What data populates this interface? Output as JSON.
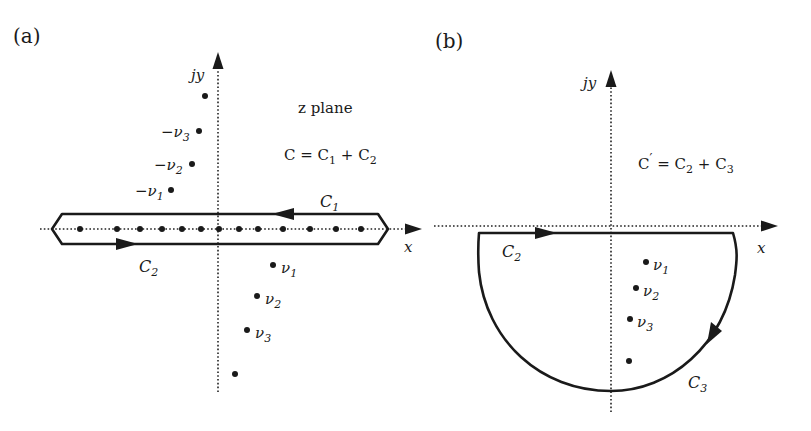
{
  "panel_a": {
    "label": "(a)",
    "y_axis_label": "jy",
    "x_axis_label": "x",
    "plane_label": "z plane",
    "equation": {
      "lhs": "C",
      "eq": " = ",
      "t1": "C",
      "s1": "1",
      "plus": " + ",
      "t2": "C",
      "s2": "2"
    },
    "contour_labels": [
      {
        "name": "C",
        "sub": "1",
        "position": "upper, right-to-left arrow"
      },
      {
        "name": "C",
        "sub": "2",
        "position": "lower, left-to-right arrow"
      }
    ],
    "upper_poles": [
      {
        "label": "",
        "x": 205,
        "y": 96
      },
      {
        "label": "−ν",
        "sub": "3",
        "x": 199,
        "y": 131
      },
      {
        "label": "−ν",
        "sub": "2",
        "x": 192,
        "y": 164
      },
      {
        "label": "−ν",
        "sub": "1",
        "x": 171,
        "y": 190
      }
    ],
    "lower_poles": [
      {
        "label": "ν",
        "sub": "1",
        "x": 273,
        "y": 265
      },
      {
        "label": "ν",
        "sub": "2",
        "x": 257,
        "y": 296
      },
      {
        "label": "ν",
        "sub": "3",
        "x": 247,
        "y": 330
      },
      {
        "label": "",
        "x": 235,
        "y": 374
      }
    ],
    "real_axis_poles_x": [
      80,
      117,
      140,
      162,
      182,
      201,
      219,
      239,
      258,
      283,
      310,
      336,
      361
    ]
  },
  "panel_b": {
    "label": "(b)",
    "y_axis_label": "jy",
    "x_axis_label": "x",
    "equation": {
      "lhs": "C",
      "prime": "′",
      "eq": " = ",
      "t1": "C",
      "s1": "2",
      "plus": " + ",
      "t2": "C",
      "s2": "3"
    },
    "contour_labels": [
      {
        "name": "C",
        "sub": "2",
        "position": "upper segment, left-to-right arrow"
      },
      {
        "name": "C",
        "sub": "3",
        "position": "lower semicircular arc, clockwise arrow"
      }
    ],
    "poles": [
      {
        "label": "ν",
        "sub": "1",
        "x": 646,
        "y": 262
      },
      {
        "label": "ν",
        "sub": "2",
        "x": 636,
        "y": 288
      },
      {
        "label": "ν",
        "sub": "3",
        "x": 630,
        "y": 319
      },
      {
        "label": "",
        "x": 629,
        "y": 361
      }
    ]
  }
}
